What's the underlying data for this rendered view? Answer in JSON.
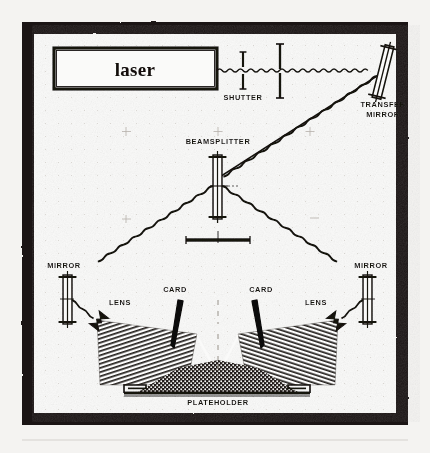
{
  "figure": {
    "kind": "scanned-optical-diagram",
    "title_text": "laser",
    "page_background": "#f7f6f4",
    "ink_color": "#17120f",
    "frame_color": "#1a1613",
    "paper_color": "#fdfdfc"
  },
  "labels": {
    "laser": "laser",
    "shutter": "SHUTTER",
    "transfer_mirror_line1": "TRANSFER",
    "transfer_mirror_line2": "MIRROR",
    "beamsplitter": "BEAMSPLITTER",
    "mirror_left": "MIRROR",
    "mirror_right": "MIRROR",
    "lens_left": "LENS",
    "lens_right": "LENS",
    "card_left": "CARD",
    "card_right": "CARD",
    "plateholder": "PLATEHOLDER"
  },
  "components": [
    {
      "name": "laser",
      "label": "laser",
      "type": "source-box"
    },
    {
      "name": "shutter",
      "label": "SHUTTER",
      "type": "shutter"
    },
    {
      "name": "aperture",
      "label": "",
      "type": "aperture-stop"
    },
    {
      "name": "transfer-mirror",
      "label": "TRANSFER MIRROR",
      "type": "tilted-mirror"
    },
    {
      "name": "beamsplitter",
      "label": "BEAMSPLITTER",
      "type": "beamsplitter"
    },
    {
      "name": "bench-bar",
      "label": "",
      "type": "support-bar"
    },
    {
      "name": "mirror-left",
      "label": "MIRROR",
      "type": "flat-mirror"
    },
    {
      "name": "mirror-right",
      "label": "MIRROR",
      "type": "flat-mirror"
    },
    {
      "name": "lens-left",
      "label": "LENS",
      "type": "diverging-lens"
    },
    {
      "name": "lens-right",
      "label": "LENS",
      "type": "diverging-lens"
    },
    {
      "name": "card-left",
      "label": "CARD",
      "type": "beam-block-card"
    },
    {
      "name": "card-right",
      "label": "CARD",
      "type": "beam-block-card"
    },
    {
      "name": "plateholder",
      "label": "PLATEHOLDER",
      "type": "plate-holder"
    }
  ],
  "beam_paths": [
    {
      "name": "laser-to-transfer-mirror",
      "style": "wavy-horizontal"
    },
    {
      "name": "transfer-mirror-to-beamsplitter",
      "style": "wavy-diagonal"
    },
    {
      "name": "beamsplitter-to-left-mirror",
      "style": "wavy-diagonal"
    },
    {
      "name": "beamsplitter-to-right-mirror",
      "style": "wavy-diagonal"
    },
    {
      "name": "left-mirror-to-left-lens",
      "style": "wavy-diagonal"
    },
    {
      "name": "right-mirror-to-right-lens",
      "style": "wavy-diagonal"
    },
    {
      "name": "left-cone-to-plate",
      "style": "hatched-cone"
    },
    {
      "name": "right-cone-to-plate",
      "style": "hatched-cone"
    }
  ]
}
